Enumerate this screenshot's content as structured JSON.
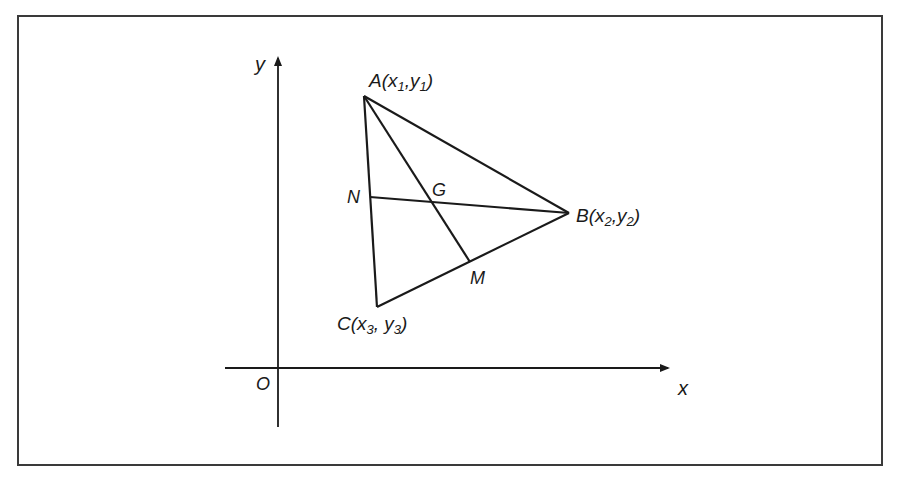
{
  "figure": {
    "type": "triangle-centroid-coordinate-diagram",
    "axes": {
      "x_label": "x",
      "y_label": "y",
      "origin_label": "O"
    },
    "vertices": {
      "A": {
        "name": "A",
        "label": "A(x₁,y₁)",
        "base": "A(x",
        "sub1": "1",
        "mid": ",y",
        "sub2": "1",
        "end": ")"
      },
      "B": {
        "name": "B",
        "label": "B(x₂,y₂)",
        "base": "B(x",
        "sub1": "2",
        "mid": ",y",
        "sub2": "2",
        "end": ")"
      },
      "C": {
        "name": "C",
        "label": "C(x₃, y₃)",
        "base": "C(x",
        "sub1": "3",
        "mid": ", y",
        "sub2": "3",
        "end": ")"
      }
    },
    "points": {
      "N": "N",
      "M": "M",
      "G": "G"
    },
    "segments": [
      "AB",
      "BC",
      "CA",
      "AM",
      "BN"
    ]
  },
  "colors": {
    "line": "#1a1a1a",
    "frame": "#3a3a3a",
    "background": "#ffffff"
  }
}
